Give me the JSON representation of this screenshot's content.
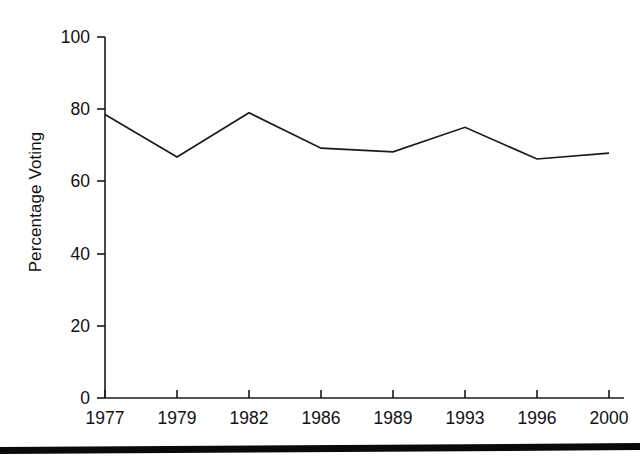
{
  "chart_data": {
    "type": "line",
    "title": "",
    "xlabel": "",
    "ylabel": "Percentage Voting",
    "categories": [
      "1977",
      "1979",
      "1982",
      "1986",
      "1989",
      "1993",
      "1996",
      "2000"
    ],
    "values": [
      78.5,
      66.8,
      79.0,
      69.2,
      68.2,
      75.0,
      66.2,
      67.8
    ],
    "series": [
      {
        "name": "Percentage Voting",
        "values": [
          78.5,
          66.8,
          79.0,
          69.2,
          68.2,
          75.0,
          66.2,
          67.8
        ]
      }
    ],
    "ylim": [
      0,
      100
    ],
    "yticks": [
      0,
      20,
      40,
      60,
      80,
      100
    ],
    "ytick_labels": [
      "0",
      "20",
      "40",
      "60",
      "80",
      "100"
    ],
    "xtick_labels": [
      "1977",
      "1979",
      "1982",
      "1986",
      "1989",
      "1993",
      "1996",
      "2000"
    ],
    "grid": false,
    "legend": false,
    "legend_position": "none",
    "line_color": "#1a1a1a",
    "axis_color": "#1a1a1a",
    "background_color": "#ffffff",
    "markers": false
  },
  "artifact": {
    "name": "scan-edge-bar",
    "color": "#0a0a0a"
  }
}
